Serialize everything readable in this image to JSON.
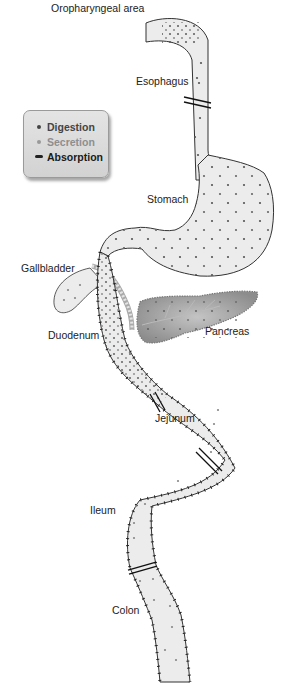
{
  "labels": {
    "oropharyngeal": "Oropharyngeal area",
    "esophagus": "Esophagus",
    "stomach": "Stomach",
    "gallbladder": "Gallbladder",
    "duodenum": "Duodenum",
    "pancreas": "Pancreas",
    "jejunum": "Jejunum",
    "ileum": "Ileum",
    "colon": "Colon"
  },
  "legend": {
    "items": [
      {
        "label": "Digestion",
        "marker": "dot",
        "color": "#4a4a4a"
      },
      {
        "label": "Secretion",
        "marker": "dot",
        "color": "#9a9a9a"
      },
      {
        "label": "Absorption",
        "marker": "tick",
        "color": "#1a1a1a"
      }
    ]
  },
  "colors": {
    "tract_fill": "#ececec",
    "outline": "#333333",
    "pancreas_fill": "#9a9a9a",
    "legend_bg": "#dcdcdc"
  }
}
